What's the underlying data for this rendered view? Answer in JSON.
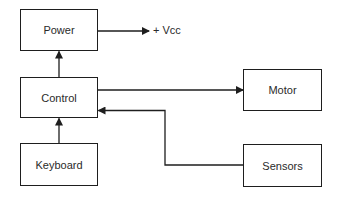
{
  "diagram": {
    "type": "block-diagram",
    "blocks": [
      {
        "id": "power",
        "label": "Power"
      },
      {
        "id": "control",
        "label": "Control"
      },
      {
        "id": "keyboard",
        "label": "Keyboard"
      },
      {
        "id": "motor",
        "label": "Motor"
      },
      {
        "id": "sensors",
        "label": "Sensors"
      }
    ],
    "terminals": [
      {
        "id": "vcc",
        "label": "+ Vcc"
      }
    ],
    "connections": [
      {
        "from": "power",
        "to": "vcc"
      },
      {
        "from": "control",
        "to": "power"
      },
      {
        "from": "keyboard",
        "to": "control"
      },
      {
        "from": "control",
        "to": "motor"
      },
      {
        "from": "sensors",
        "to": "control"
      }
    ],
    "colors": {
      "stroke": "#1e1e1e",
      "text": "#2a2a2a",
      "background": "#ffffff"
    }
  }
}
